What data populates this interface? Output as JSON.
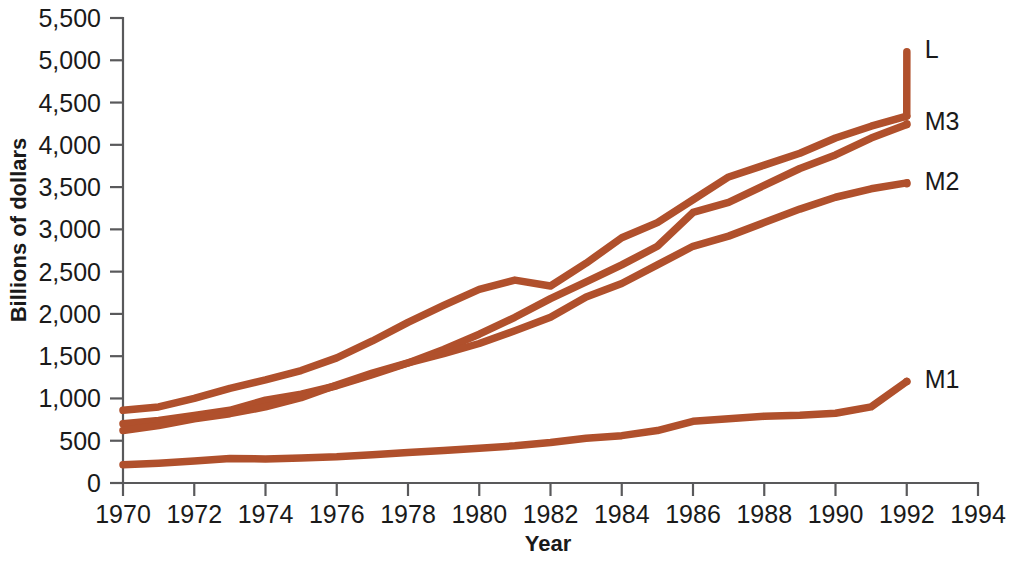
{
  "chart_data": {
    "type": "line",
    "title": "",
    "xlabel": "Year",
    "ylabel": "Billions of dollars",
    "xlim": [
      1970,
      1994
    ],
    "ylim": [
      0,
      5500
    ],
    "xticks": [
      1970,
      1972,
      1974,
      1976,
      1978,
      1980,
      1982,
      1984,
      1986,
      1988,
      1990,
      1992,
      1994
    ],
    "yticks": [
      0,
      500,
      1000,
      1500,
      2000,
      2500,
      3000,
      3500,
      4000,
      4500,
      5000,
      5500
    ],
    "xtick_labels": [
      "1970",
      "1972",
      "1974",
      "1976",
      "1978",
      "1980",
      "1982",
      "1984",
      "1986",
      "1988",
      "1990",
      "1992",
      "1994"
    ],
    "ytick_labels": [
      "0",
      "500",
      "1,000",
      "1,500",
      "2,000",
      "2,500",
      "3,000",
      "3,500",
      "4,000",
      "4,500",
      "5,000",
      "5,500"
    ],
    "grid": false,
    "legend_position": "right-inline-labels",
    "line_color": "#b0502c",
    "axis_color": "#59595b",
    "text_color": "#1a1a1a",
    "x": [
      1970,
      1971,
      1972,
      1973,
      1974,
      1975,
      1976,
      1977,
      1978,
      1979,
      1980,
      1981,
      1982,
      1983,
      1984,
      1985,
      1986,
      1987,
      1988,
      1989,
      1990,
      1991,
      1992
    ],
    "series": [
      {
        "name": "L",
        "label": "L",
        "label_x": 1994.1,
        "label_y": 5100,
        "values": [
          860,
          900,
          1000,
          1120,
          1220,
          1330,
          1480,
          1680,
          1900,
          2100,
          2290,
          2400,
          2330,
          2600,
          2900,
          3080,
          3350,
          3620,
          3760,
          3900,
          4080,
          4220,
          4340
        ]
      },
      {
        "name": "M3",
        "label": "M3",
        "label_x": 1994.1,
        "label_y": 4250,
        "values": [
          700,
          740,
          800,
          860,
          980,
          1050,
          1150,
          1280,
          1420,
          1580,
          1760,
          1960,
          2180,
          2380,
          2580,
          2800,
          3200,
          3320,
          3520,
          3720,
          3880,
          4080,
          4240
        ]
      },
      {
        "name": "M2",
        "label": "M2",
        "label_x": 1994.1,
        "label_y": 3540,
        "values": [
          620,
          680,
          760,
          820,
          900,
          1010,
          1160,
          1300,
          1420,
          1530,
          1650,
          1800,
          1960,
          2200,
          2360,
          2580,
          2800,
          2920,
          3080,
          3240,
          3380,
          3480,
          3550
        ]
      },
      {
        "name": "M1",
        "label": "M1",
        "label_x": 1994.1,
        "label_y": 1200,
        "values": [
          215,
          235,
          260,
          290,
          285,
          295,
          310,
          335,
          360,
          385,
          410,
          440,
          480,
          530,
          560,
          620,
          730,
          760,
          790,
          800,
          825,
          900,
          1200
        ]
      }
    ],
    "annotations": []
  },
  "axis": {
    "y_title": "Billions of dollars",
    "x_title": "Year"
  }
}
